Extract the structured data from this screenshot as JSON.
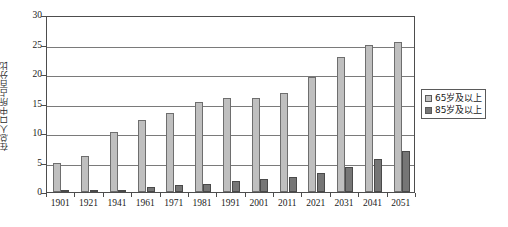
{
  "chart_data": {
    "type": "bar",
    "title": "",
    "xlabel": "",
    "ylabel": "在总人口中所占百分比",
    "ylim": [
      0,
      30
    ],
    "ytick_values": [
      0,
      5,
      10,
      15,
      20,
      25,
      30
    ],
    "ytick_labels": [
      "0",
      "5",
      "10",
      "15",
      "20",
      "25",
      "30"
    ],
    "grid": true,
    "legend_position": "right",
    "categories": [
      "1901",
      "1921",
      "1941",
      "1961",
      "1971",
      "1981",
      "1991",
      "2001",
      "2011",
      "2021",
      "2031",
      "2041",
      "2051"
    ],
    "series": [
      {
        "name": "65岁及以上",
        "color": "#bfbfbf",
        "values": [
          5.0,
          6.1,
          10.2,
          12.2,
          13.4,
          15.2,
          16.0,
          16.0,
          16.8,
          19.5,
          22.8,
          25.0,
          25.4
        ]
      },
      {
        "name": "85岁及以上",
        "color": "#767676",
        "values": [
          0.2,
          0.3,
          0.4,
          0.8,
          1.2,
          1.4,
          1.8,
          2.2,
          2.5,
          3.2,
          4.2,
          5.6,
          6.9
        ]
      }
    ]
  },
  "legend": {
    "items": [
      {
        "label": "65岁及以上",
        "swatch": "s1"
      },
      {
        "label": "85岁及以上",
        "swatch": "s2"
      }
    ]
  },
  "caption": {
    "text": ""
  }
}
